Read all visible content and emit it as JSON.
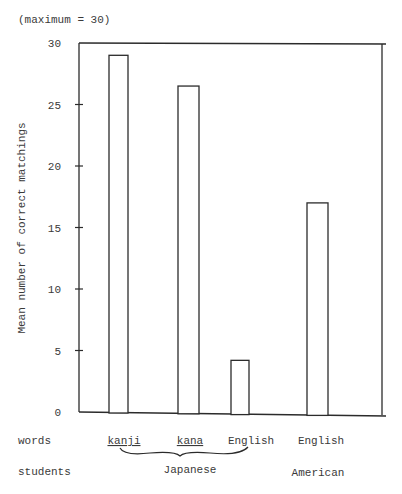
{
  "chart_data": {
    "type": "bar",
    "title": "",
    "annotation": "(maximum = 30)",
    "ylabel": "Mean number of correct matchings",
    "xlabel": "",
    "ylim": [
      0,
      30
    ],
    "yticks": [
      0,
      5,
      10,
      15,
      20,
      25,
      30
    ],
    "grid": false,
    "legend": null,
    "categories": [
      "kanji",
      "kana",
      "English",
      "English"
    ],
    "values": [
      29,
      26.5,
      4.2,
      17
    ],
    "category_underlined": [
      true,
      true,
      false,
      false
    ],
    "row_labels": {
      "words": "words",
      "students": "students"
    },
    "groups": [
      {
        "label": "Japanese",
        "categories": [
          0,
          1,
          2
        ],
        "bracketed": true
      },
      {
        "label": "American",
        "categories": [
          3
        ],
        "bracketed": false
      }
    ]
  }
}
